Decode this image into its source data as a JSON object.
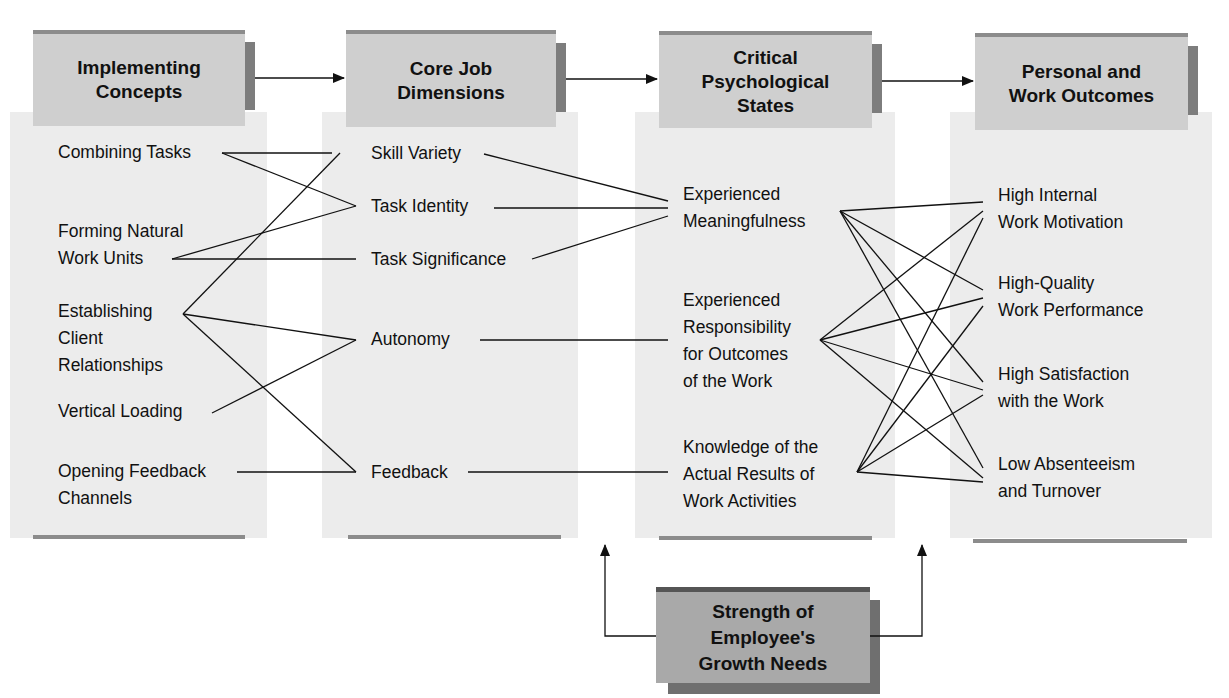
{
  "headers": {
    "implementing": [
      "Implementing",
      "Concepts"
    ],
    "core": [
      "Core Job",
      "Dimensions"
    ],
    "critical": [
      "Critical",
      "Psychological",
      "States"
    ],
    "outcomes": [
      "Personal and",
      "Work Outcomes"
    ]
  },
  "implementing_concepts": [
    {
      "lines": [
        "Combining Tasks"
      ]
    },
    {
      "lines": [
        "Forming Natural",
        "Work Units"
      ]
    },
    {
      "lines": [
        "Establishing",
        "Client",
        "Relationships"
      ]
    },
    {
      "lines": [
        "Vertical Loading"
      ]
    },
    {
      "lines": [
        "Opening Feedback",
        "Channels"
      ]
    }
  ],
  "core_job_dimensions": [
    {
      "lines": [
        "Skill Variety"
      ]
    },
    {
      "lines": [
        "Task Identity"
      ]
    },
    {
      "lines": [
        "Task Significance"
      ]
    },
    {
      "lines": [
        "Autonomy"
      ]
    },
    {
      "lines": [
        "Feedback"
      ]
    }
  ],
  "critical_states": [
    {
      "lines": [
        "Experienced",
        "Meaningfulness"
      ]
    },
    {
      "lines": [
        "Experienced",
        "Responsibility",
        "for Outcomes",
        "of the Work"
      ]
    },
    {
      "lines": [
        "Knowledge of the",
        "Actual Results of",
        "Work Activities"
      ]
    }
  ],
  "outcomes": [
    {
      "lines": [
        "High Internal",
        "Work Motivation"
      ]
    },
    {
      "lines": [
        "High-Quality",
        "Work Performance"
      ]
    },
    {
      "lines": [
        "High Satisfaction",
        "with the Work"
      ]
    },
    {
      "lines": [
        "Low Absenteeism",
        "and Turnover"
      ]
    }
  ],
  "moderator": [
    "Strength of",
    "Employee's",
    "Growth Needs"
  ],
  "connections": {
    "concepts_to_dimensions": [
      [
        "Combining Tasks",
        "Skill Variety"
      ],
      [
        "Combining Tasks",
        "Task Identity"
      ],
      [
        "Forming Natural Work Units",
        "Task Identity"
      ],
      [
        "Forming Natural Work Units",
        "Task Significance"
      ],
      [
        "Establishing Client Relationships",
        "Skill Variety"
      ],
      [
        "Establishing Client Relationships",
        "Autonomy"
      ],
      [
        "Establishing Client Relationships",
        "Feedback"
      ],
      [
        "Vertical Loading",
        "Autonomy"
      ],
      [
        "Opening Feedback Channels",
        "Feedback"
      ]
    ],
    "dimensions_to_states": [
      [
        "Skill Variety",
        "Experienced Meaningfulness"
      ],
      [
        "Task Identity",
        "Experienced Meaningfulness"
      ],
      [
        "Task Significance",
        "Experienced Meaningfulness"
      ],
      [
        "Autonomy",
        "Experienced Responsibility for Outcomes of the Work"
      ],
      [
        "Feedback",
        "Knowledge of the Actual Results of Work Activities"
      ]
    ],
    "states_to_outcomes": "each of the 3 states connects to all 4 outcomes"
  },
  "colors": {
    "header_fill": "#cfcfcf",
    "column_fill": "#ececec",
    "accent_bar": "#7d7d7d",
    "moderator_fill": "#a9a9a9",
    "line": "#111111"
  }
}
